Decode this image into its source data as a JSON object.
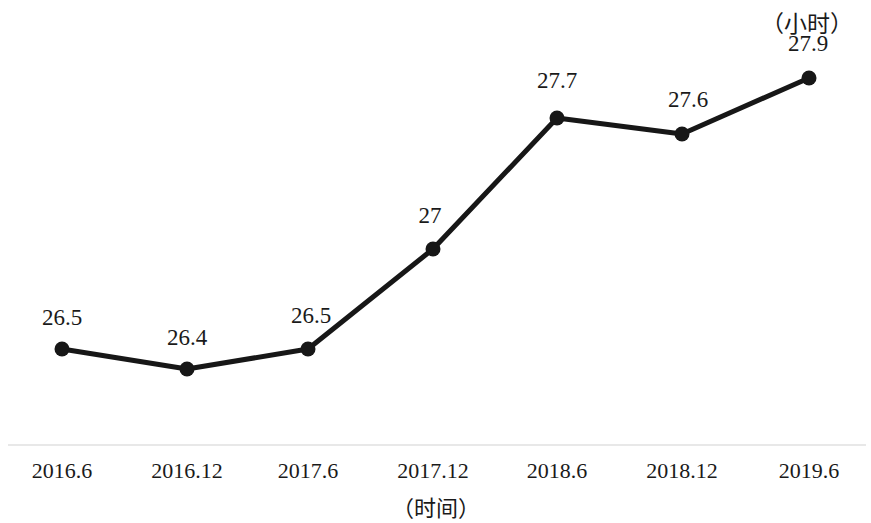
{
  "chart_data": {
    "type": "line",
    "title": "",
    "subtitle": "",
    "xlabel": "（时间）",
    "ylabel": "",
    "unit_label": "（小时）",
    "categories": [
      "2016.6",
      "2016.12",
      "2017.6",
      "2017.12",
      "2018.6",
      "2018.12",
      "2019.6"
    ],
    "values": [
      26.5,
      26.4,
      26.5,
      27,
      27.7,
      27.6,
      27.9
    ],
    "point_labels": [
      "26.5",
      "26.4",
      "26.5",
      "27",
      "27.7",
      "27.6",
      "27.9"
    ],
    "series": [
      {
        "name": "",
        "values": [
          26.5,
          26.4,
          26.5,
          27,
          27.7,
          27.6,
          27.9
        ]
      }
    ],
    "ylim": [
      26.3,
      28.0
    ],
    "grid": false,
    "legend": false,
    "legend_position": "none",
    "line_color": "#171717",
    "marker_color": "#171717",
    "axis_color": "#e8e8e8",
    "points": [
      {
        "label": "2016.6",
        "value": "26.5",
        "x": 62,
        "y": 349,
        "lx": 62,
        "ly": 305
      },
      {
        "label": "2016.12",
        "value": "26.4",
        "x": 187,
        "y": 369,
        "lx": 187,
        "ly": 325
      },
      {
        "label": "2017.6",
        "value": "26.5",
        "x": 308,
        "y": 349,
        "lx": 311,
        "ly": 303
      },
      {
        "label": "2017.12",
        "value": "27",
        "x": 433,
        "y": 249,
        "lx": 430,
        "ly": 203
      },
      {
        "label": "2018.6",
        "value": "27.7",
        "x": 557,
        "y": 118,
        "lx": 557,
        "ly": 68
      },
      {
        "label": "2018.12",
        "value": "27.6",
        "x": 682,
        "y": 134,
        "lx": 688,
        "ly": 87
      },
      {
        "label": "2019.6",
        "value": "27.9",
        "x": 809,
        "y": 78,
        "lx": 808,
        "ly": 31
      }
    ],
    "axis_line_y": 445
  }
}
